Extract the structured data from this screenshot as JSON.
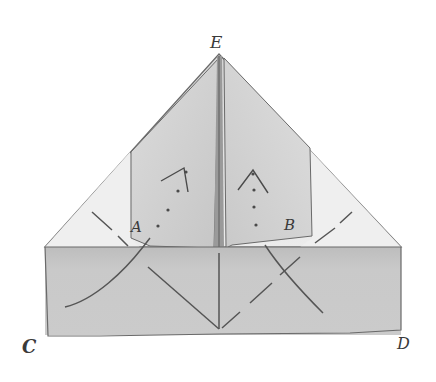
{
  "diagram": {
    "type": "origami-fold-illustration",
    "labels": {
      "E": "E",
      "A": "A",
      "B": "B",
      "C": "C",
      "D": "D"
    },
    "colors": {
      "background": "#ffffff",
      "outer_triangle": "#e6e6e6",
      "outer_triangle_light": "#efefef",
      "flap": "#cfcfcf",
      "band": "#c4c4c4",
      "center_crease": "#8c8c8c",
      "line": "#5a5a5a"
    }
  }
}
